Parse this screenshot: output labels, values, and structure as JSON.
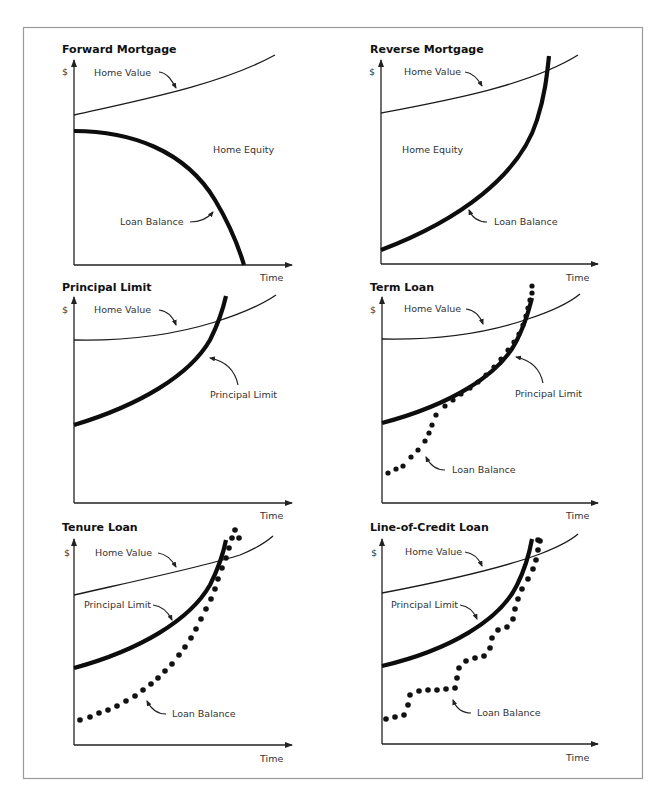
{
  "figure": {
    "panels": [
      {
        "id": "forward-mortgage",
        "title": "Forward Mortgage",
        "y_axis_label": "$",
        "x_axis_label": "Time",
        "labels": {
          "home_value": "Home Value",
          "home_equity": "Home Equity",
          "loan_balance": "Loan Balance"
        }
      },
      {
        "id": "reverse-mortgage",
        "title": "Reverse Mortgage",
        "y_axis_label": "$",
        "x_axis_label": "Time",
        "labels": {
          "home_value": "Home Value",
          "home_equity": "Home Equity",
          "loan_balance": "Loan Balance"
        }
      },
      {
        "id": "principal-limit",
        "title": "Principal Limit",
        "y_axis_label": "$",
        "x_axis_label": "Time",
        "labels": {
          "home_value": "Home Value",
          "principal_limit": "Principal Limit"
        }
      },
      {
        "id": "term-loan",
        "title": "Term Loan",
        "y_axis_label": "$",
        "x_axis_label": "Time",
        "labels": {
          "home_value": "Home Value",
          "principal_limit": "Principal Limit",
          "loan_balance": "Loan Balance"
        }
      },
      {
        "id": "tenure-loan",
        "title": "Tenure Loan",
        "y_axis_label": "$",
        "x_axis_label": "Time",
        "labels": {
          "home_value": "Home Value",
          "principal_limit": "Principal Limit",
          "loan_balance": "Loan Balance"
        }
      },
      {
        "id": "line-of-credit-loan",
        "title": "Line-of-Credit Loan",
        "y_axis_label": "$",
        "x_axis_label": "Time",
        "labels": {
          "home_value": "Home Value",
          "principal_limit": "Principal Limit",
          "loan_balance": "Loan Balance"
        }
      }
    ],
    "colors": {
      "line": "#111111",
      "frame": "#9a9a9a",
      "text": "#333333",
      "background": "#ffffff"
    }
  }
}
